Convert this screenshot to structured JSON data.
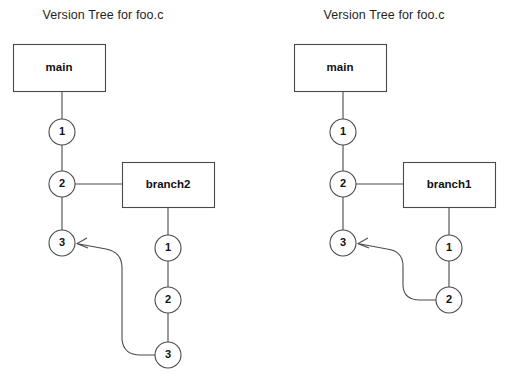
{
  "page": {
    "background_color": "#ffffff",
    "line_color": "#4a4a4a",
    "text_color": "#111111",
    "width": 510,
    "height": 381
  },
  "diagrams": [
    {
      "id": "left",
      "title": "Version Tree for foo.c",
      "trunk_box_label": "main",
      "trunk_nodes": [
        "1",
        "2",
        "3"
      ],
      "branch_box_label": "branch2",
      "branch_nodes": [
        "1",
        "2",
        "3"
      ],
      "merge_from_node": "3",
      "merge_to_node": "3"
    },
    {
      "id": "right",
      "title": "Version Tree for foo.c",
      "trunk_box_label": "main",
      "trunk_nodes": [
        "1",
        "2",
        "3"
      ],
      "branch_box_label": "branch1",
      "branch_nodes": [
        "1",
        "2"
      ],
      "merge_from_node": "2",
      "merge_to_node": "3"
    }
  ]
}
